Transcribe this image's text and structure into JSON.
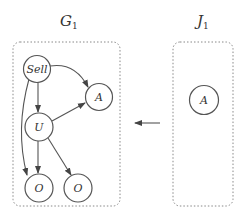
{
  "diagram": {
    "left_graph": {
      "title": "G",
      "subscript": "1",
      "nodes": [
        {
          "id": "sell",
          "label": "Sell"
        },
        {
          "id": "a",
          "label": "A"
        },
        {
          "id": "u",
          "label": "U"
        },
        {
          "id": "o1",
          "label": "O"
        },
        {
          "id": "o2",
          "label": "O"
        }
      ],
      "edges": [
        {
          "from": "sell",
          "to": "a"
        },
        {
          "from": "sell",
          "to": "u"
        },
        {
          "from": "sell",
          "to": "o1"
        },
        {
          "from": "u",
          "to": "a"
        },
        {
          "from": "u",
          "to": "o1"
        },
        {
          "from": "u",
          "to": "o2"
        }
      ]
    },
    "right_graph": {
      "title": "J",
      "subscript": "1",
      "nodes": [
        {
          "id": "a",
          "label": "A"
        }
      ]
    },
    "mapping_arrow": {
      "from": "right_graph",
      "to": "left_graph"
    },
    "colors": {
      "stroke": "#555555",
      "box": "#888888",
      "text": "#333333"
    }
  }
}
